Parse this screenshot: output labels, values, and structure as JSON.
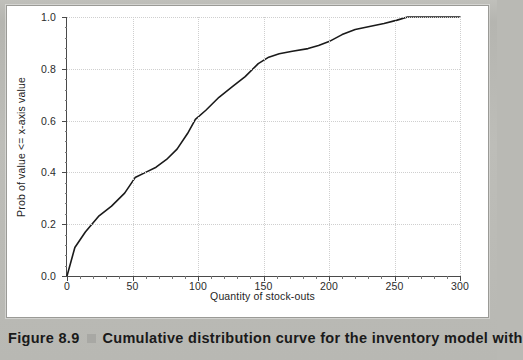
{
  "caption": {
    "figure_number": "Figure 8.9",
    "marker": "gray-square-marker",
    "text": "Cumulative distribution curve for the inventory model with"
  },
  "chart_data": {
    "type": "line",
    "title": "",
    "subtitle": "",
    "xlabel": "Quantity of stock-outs",
    "ylabel": "Prob of value <= x-axis value",
    "xlim": [
      0,
      300
    ],
    "ylim": [
      0.0,
      1.0
    ],
    "xticks": [
      0,
      50,
      100,
      150,
      200,
      250,
      300
    ],
    "xtick_labels": [
      "0",
      "50",
      "100",
      "150",
      "200",
      "250",
      "300"
    ],
    "yticks": [
      0.0,
      0.2,
      0.4,
      0.6,
      0.8,
      1.0
    ],
    "ytick_labels": [
      "0.0",
      "0.2",
      "0.4",
      "0.6",
      "0.8",
      "1.0"
    ],
    "grid": true,
    "grid_style": "dotted",
    "legend": "none",
    "minor_ticks": true,
    "line_color": "#1a1a1a",
    "line_width": 1.6,
    "series": [
      {
        "name": "Cumulative probability",
        "x": [
          0,
          6,
          14,
          24,
          34,
          44,
          52,
          60,
          68,
          76,
          84,
          92,
          98,
          106,
          116,
          126,
          136,
          146,
          154,
          162,
          172,
          184,
          192,
          200,
          210,
          220,
          230,
          242,
          252,
          260,
          272,
          284,
          300
        ],
        "y": [
          0.0,
          0.11,
          0.17,
          0.23,
          0.27,
          0.32,
          0.38,
          0.4,
          0.42,
          0.45,
          0.49,
          0.55,
          0.605,
          0.64,
          0.69,
          0.73,
          0.77,
          0.82,
          0.845,
          0.858,
          0.868,
          0.878,
          0.89,
          0.905,
          0.932,
          0.952,
          0.962,
          0.975,
          0.988,
          1.0,
          1.0,
          1.0,
          1.0
        ]
      }
    ]
  }
}
